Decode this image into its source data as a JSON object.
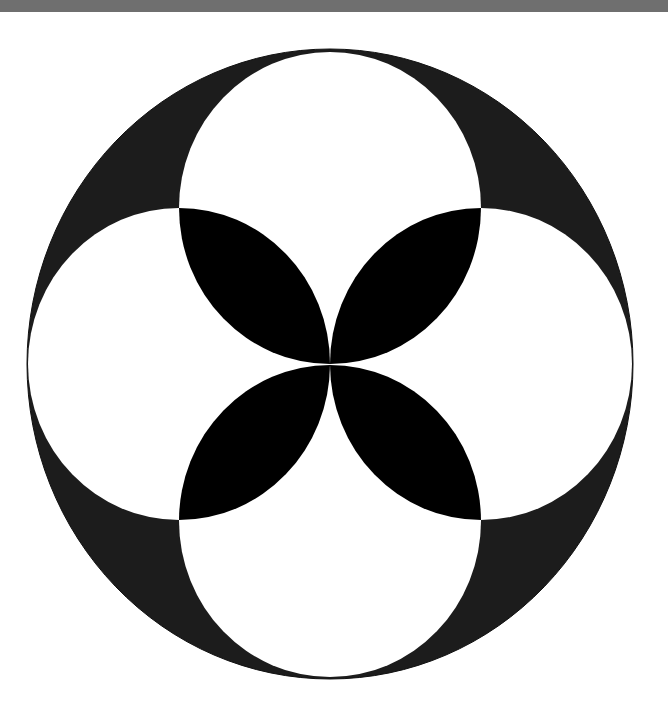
{
  "figure": {
    "colors": {
      "top_bar": "#6f6f6f",
      "background": "#ffffff",
      "outer_disc": "#1c1c1c",
      "circles": "#ffffff",
      "petals": "#000000"
    },
    "outer": {
      "cx": 330,
      "cy": 364,
      "rx": 303,
      "ry": 315
    },
    "inner_square": {
      "x1": 179,
      "y1": 208,
      "x2": 481,
      "y2": 521
    },
    "small_circles": [
      {
        "name": "top",
        "cx": 330,
        "cy": 208,
        "rx": 151,
        "ry": 156
      },
      {
        "name": "right",
        "cx": 481,
        "cy": 364,
        "rx": 151,
        "ry": 156
      },
      {
        "name": "bottom",
        "cx": 330,
        "cy": 521,
        "rx": 151,
        "ry": 156
      },
      {
        "name": "left",
        "cx": 179,
        "cy": 364,
        "rx": 151,
        "ry": 156
      }
    ],
    "petal_count": 4
  }
}
